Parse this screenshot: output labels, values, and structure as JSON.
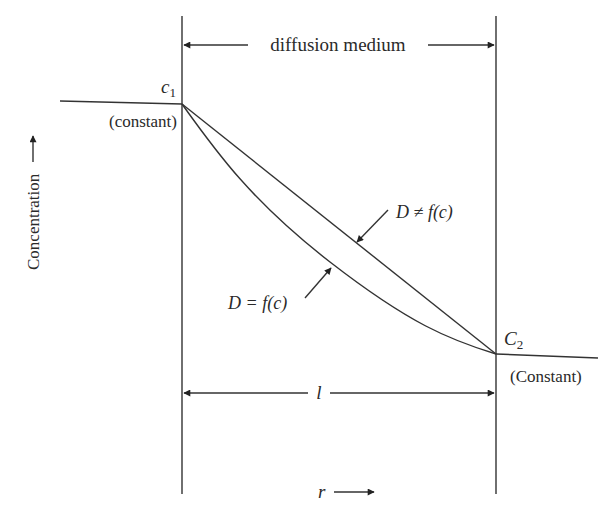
{
  "diagram": {
    "top_dimension": {
      "label": "diffusion medium"
    },
    "bottom_dimension": {
      "label": "l"
    },
    "left_boundary": {
      "symbol": "c",
      "subscript": "1",
      "note": "(constant)"
    },
    "right_boundary": {
      "symbol": "C",
      "subscript": "2",
      "note": "(Constant)"
    },
    "y_axis": {
      "label": "Concentration",
      "arrow": "→"
    },
    "x_axis": {
      "label": "r"
    },
    "curves": [
      {
        "name": "linear",
        "label": "D ≠ f(c)"
      },
      {
        "name": "curved",
        "label": "D = f(c)"
      }
    ],
    "colors": {
      "line": "#333333",
      "text": "#2a2a2a",
      "background": "#ffffff"
    }
  }
}
